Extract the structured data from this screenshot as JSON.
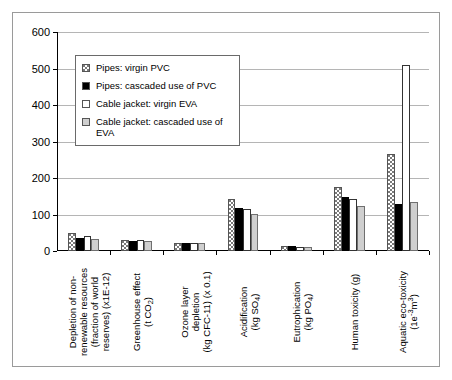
{
  "chart_data": {
    "type": "bar",
    "title": "",
    "xlabel": "",
    "ylabel": "",
    "ylim": [
      0,
      600
    ],
    "yticks": [
      0,
      100,
      200,
      300,
      400,
      500,
      600
    ],
    "grid": true,
    "legend_position": "inside-top-left",
    "categories": [
      "Depletion of non-renewable resources (fraction of world reserves) (x1E-12)",
      "Greenhouse effect (t CO2)",
      "Ozone layer depletion (kg CFC-11) (x 0.1)",
      "Acidification (kg SO4)",
      "Eutrophication (kg PO4)",
      "Human toxicity (g)",
      "Aquatic eco-toxicity (1e-3 m3)"
    ],
    "series": [
      {
        "name": "Pipes: virgin PVC",
        "values": [
          48,
          30,
          23,
          143,
          15,
          176,
          267
        ]
      },
      {
        "name": "Pipes: cascaded use of PVC",
        "values": [
          37,
          28,
          22,
          119,
          13,
          147,
          130
        ]
      },
      {
        "name": "Cable jacket: virgin EVA",
        "values": [
          42,
          30,
          22,
          115,
          12,
          142,
          510
        ]
      },
      {
        "name": "Cable jacket: cascaded use of EVA",
        "values": [
          33,
          28,
          23,
          101,
          12,
          124,
          135
        ]
      }
    ]
  },
  "legend": {
    "items": [
      {
        "label": "Pipes: virgin PVC",
        "swatch": "dotted"
      },
      {
        "label": "Pipes: cascaded use of PVC",
        "swatch": "solid-black"
      },
      {
        "label": "Cable jacket: virgin EVA",
        "swatch": "white"
      },
      {
        "label": "Cable jacket: cascaded use of EVA",
        "swatch": "light-gray"
      }
    ]
  },
  "yaxis": {
    "ticks": [
      "0",
      "100",
      "200",
      "300",
      "400",
      "500",
      "600"
    ]
  },
  "xaxis": {
    "categories": [
      {
        "lines": [
          "Depletion of non-",
          "renewable resources",
          "(fraction of world",
          "reserves) (x1E-12)"
        ]
      },
      {
        "lines": [
          "Greenhouse effect",
          "(t CO2)"
        ]
      },
      {
        "lines": [
          "Ozone layer",
          "depletion",
          "(kg CFC-11) (x 0.1)"
        ]
      },
      {
        "lines": [
          "Acidification",
          "(kg SO4)"
        ]
      },
      {
        "lines": [
          "Eutrophication",
          "(kg PO4)"
        ]
      },
      {
        "lines": [
          "Human toxicity (g)"
        ]
      },
      {
        "lines": [
          "Aquatic eco-toxicity",
          "(1e-3m3)"
        ]
      }
    ]
  },
  "colors": {
    "series_dotted": "#ffffff",
    "series_black": "#000000",
    "series_white": "#ffffff",
    "series_gray": "#cfcfcf",
    "gridline": "#b5b5b5",
    "axis": "#000000",
    "frame": "#9a9a9a"
  }
}
